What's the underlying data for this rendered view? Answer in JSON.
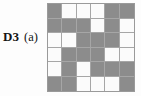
{
  "figure": {
    "label": {
      "id": "D3",
      "part": "(a)"
    },
    "background_color": "#fdfdfd"
  },
  "grid": {
    "rows": 6,
    "columns": 6,
    "filled_color": "#8c8c8c",
    "empty_color": "#fbfbfb",
    "gridline_color": "#a6a6a6",
    "border_color": "#9a9a9a",
    "legend": {
      "filled": "gray",
      "empty": "white"
    },
    "cells": [
      [
        "filled",
        "empty",
        "empty",
        "empty",
        "filled",
        "filled"
      ],
      [
        "filled",
        "filled",
        "filled",
        "empty",
        "filled",
        "empty"
      ],
      [
        "empty",
        "empty",
        "filled",
        "filled",
        "filled",
        "empty"
      ],
      [
        "empty",
        "filled",
        "filled",
        "filled",
        "empty",
        "empty"
      ],
      [
        "empty",
        "filled",
        "empty",
        "filled",
        "filled",
        "filled"
      ],
      [
        "filled",
        "filled",
        "empty",
        "empty",
        "empty",
        "filled"
      ]
    ],
    "filled_count": 21,
    "empty_count": 15
  }
}
